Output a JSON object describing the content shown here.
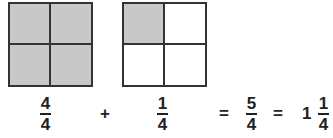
{
  "diagram": {
    "squares": [
      {
        "id": "square-1",
        "parts": 4,
        "shaded": [
          true,
          true,
          true,
          true
        ]
      },
      {
        "id": "square-2",
        "parts": 4,
        "shaded": [
          true,
          false,
          false,
          false
        ]
      }
    ],
    "colors": {
      "shaded": "#c8c8c8",
      "border": "#333333"
    }
  },
  "equation": {
    "term1": {
      "num": "4",
      "den": "4"
    },
    "plus": "+",
    "term2": {
      "num": "1",
      "den": "4"
    },
    "eq1": "=",
    "result": {
      "num": "5",
      "den": "4"
    },
    "eq2": "=",
    "mixed": {
      "whole": "1",
      "num": "1",
      "den": "4"
    }
  }
}
